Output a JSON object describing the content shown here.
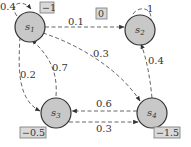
{
  "diagram": {
    "type": "markov_reward_process",
    "colors": {
      "node_fill": "#c8c8c8",
      "node_stroke": "#333333",
      "reward_box_fill": "#d9d9d9",
      "edge": "#555555"
    },
    "nodes": [
      {
        "id": "s1",
        "label": "s",
        "sub": "1",
        "reward": "−1"
      },
      {
        "id": "s2",
        "label": "s",
        "sub": "2",
        "reward": "0"
      },
      {
        "id": "s3",
        "label": "s",
        "sub": "3",
        "reward": "−0.5"
      },
      {
        "id": "s4",
        "label": "s",
        "sub": "4",
        "reward": "−1.5"
      }
    ],
    "edges": [
      {
        "from": "s1",
        "to": "s1",
        "prob": "0.4"
      },
      {
        "from": "s1",
        "to": "s2",
        "prob": "0.1"
      },
      {
        "from": "s1",
        "to": "s3",
        "prob": "0.2"
      },
      {
        "from": "s1",
        "to": "s4",
        "prob": "0.3"
      },
      {
        "from": "s2",
        "to": "s2",
        "prob": "1"
      },
      {
        "from": "s3",
        "to": "s1",
        "prob": "0.7"
      },
      {
        "from": "s3",
        "to": "s4",
        "prob": "0.3"
      },
      {
        "from": "s4",
        "to": "s2",
        "prob": "0.4"
      },
      {
        "from": "s4",
        "to": "s3",
        "prob": "0.6"
      }
    ]
  }
}
